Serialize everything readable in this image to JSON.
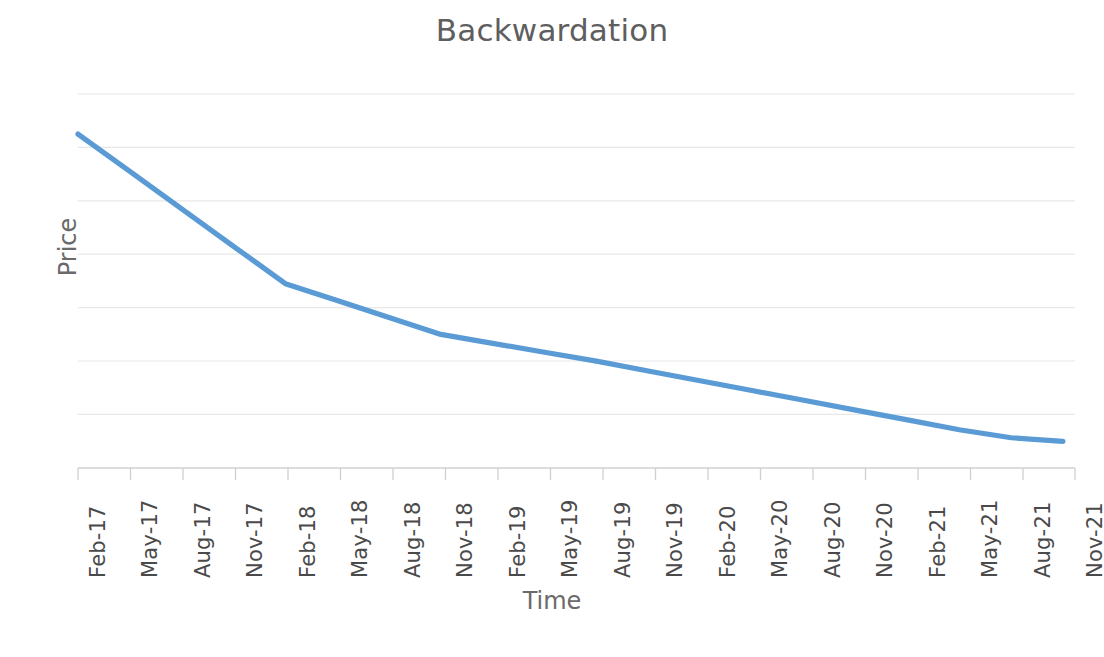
{
  "chart_data": {
    "type": "line",
    "title": "Backwardation",
    "xlabel": "Time",
    "ylabel": "Price",
    "grid": true,
    "legend": false,
    "categories": [
      "Feb-17",
      "May-17",
      "Aug-17",
      "Nov-17",
      "Feb-18",
      "May-18",
      "Aug-18",
      "Nov-18",
      "Feb-19",
      "May-19",
      "Aug-19",
      "Nov-19",
      "Feb-20",
      "May-20",
      "Aug-20",
      "Nov-20",
      "Feb-21",
      "May-21",
      "Aug-21",
      "Nov-21"
    ],
    "series": [
      {
        "name": "Futures price curve",
        "color": "#5B9BD5",
        "values": [
          100.0,
          91.6,
          83.2,
          74.8,
          66.4,
          62.6,
          58.8,
          55.0,
          53.0,
          51.0,
          49.0,
          46.8,
          44.6,
          42.4,
          40.2,
          38.0,
          35.8,
          33.6,
          31.8,
          31.0
        ]
      }
    ],
    "ylim": [
      25,
      109
    ],
    "y_gridline_count": 7,
    "axis_line_color": "#d9d9d9",
    "gridline_color": "#e8e8e8",
    "annotation": "Downward sloping forward curve: spot price above deferred futures prices."
  }
}
